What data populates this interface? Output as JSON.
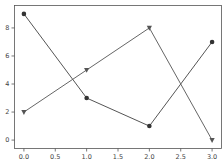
{
  "chart_data": {
    "type": "line",
    "title": "",
    "xlabel": "",
    "ylabel": "",
    "x": [
      0,
      1,
      2,
      3
    ],
    "series": [
      {
        "name": "series-circle",
        "marker": "circle",
        "color": "#555555",
        "values": [
          9,
          3,
          1,
          7
        ]
      },
      {
        "name": "series-triangle",
        "marker": "triangle-down",
        "color": "#666666",
        "values": [
          2,
          5,
          8,
          0
        ]
      }
    ],
    "xlim": [
      -0.15,
      3.15
    ],
    "ylim": [
      -0.6,
      9.6
    ],
    "xticks": [
      0.0,
      0.5,
      1.0,
      1.5,
      2.0,
      2.5,
      3.0
    ],
    "xtick_labels": [
      "0.0",
      "0.5",
      "1.0",
      "1.5",
      "2.0",
      "2.5",
      "3.0"
    ],
    "yticks": [
      0,
      2,
      4,
      6,
      8
    ],
    "ytick_labels": [
      "0",
      "2",
      "4",
      "6",
      "8"
    ],
    "grid": false,
    "legend": "none"
  },
  "colors": {
    "axes": "#555555",
    "text": "#444444",
    "background": "#ffffff"
  }
}
